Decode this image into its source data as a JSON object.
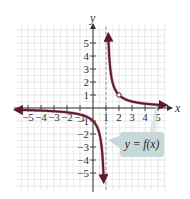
{
  "chart_data": {
    "type": "line",
    "title": "",
    "xlabel": "x",
    "ylabel": "y",
    "xlim": [
      -5.85,
      5.6
    ],
    "ylim": [
      -6.3,
      6.4
    ],
    "grid": true,
    "x_ticks": [
      -5,
      -4,
      -3,
      -2,
      -1,
      1,
      2,
      3,
      4,
      5
    ],
    "x_tick_labels": [
      "−5",
      "−4",
      "−3",
      "−2",
      "−1",
      "1",
      "2",
      "3",
      "4",
      "5"
    ],
    "y_ticks": [
      5,
      4,
      3,
      2,
      1,
      -1,
      -2,
      -3,
      -4,
      -5
    ],
    "y_tick_labels": [
      "5",
      "4",
      "3",
      "2",
      "1",
      "−1",
      "−2",
      "−3",
      "−4",
      "−5"
    ],
    "series": [
      {
        "name": "y = f(x)",
        "function": "1/(x-1)",
        "color": "#5b1a2e",
        "branches": [
          {
            "x_range": [
              -5.85,
              0.82
            ],
            "points": [
              [
                -5.8,
                -0.147
              ],
              [
                -5,
                -0.167
              ],
              [
                -4,
                -0.2
              ],
              [
                -3,
                -0.25
              ],
              [
                -2,
                -0.333
              ],
              [
                -1,
                -0.5
              ],
              [
                0,
                -1
              ],
              [
                0.5,
                -2
              ],
              [
                0.75,
                -4
              ],
              [
                0.82,
                -5.6
              ]
            ]
          },
          {
            "x_range": [
              1.18,
              5.5
            ],
            "points": [
              [
                1.18,
                5.6
              ],
              [
                1.25,
                4
              ],
              [
                1.5,
                2
              ],
              [
                2,
                1
              ],
              [
                3,
                0.5
              ],
              [
                4,
                0.333
              ],
              [
                5,
                0.25
              ],
              [
                5.5,
                0.222
              ]
            ]
          }
        ],
        "arrows_at_ends": true
      }
    ],
    "asymptotes": [
      {
        "type": "vertical",
        "x": 1,
        "style": "dashed"
      }
    ],
    "open_points": [
      [
        2,
        1
      ]
    ],
    "annotations": [
      {
        "text": "y = f(x)",
        "position": "lower-right",
        "style": "callout-box"
      }
    ]
  },
  "labels": {
    "x_axis": "x",
    "y_axis": "y",
    "callout": "y = f(x)"
  },
  "colors": {
    "curve": "#5b1a2e",
    "curve_edge": "#b0405a",
    "grid": "#e2e2e2",
    "axis": "#333333",
    "asymptote": "#8a9a9a",
    "callout_fill": "#c8d8d8"
  }
}
